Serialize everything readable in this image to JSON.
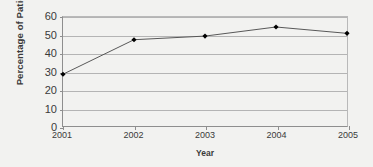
{
  "chart_data": {
    "type": "line",
    "title": "",
    "xlabel": "Year",
    "ylabel": "Percentage of Patients",
    "categories": [
      "2001",
      "2002",
      "2003",
      "2004",
      "2005"
    ],
    "values": [
      28.5,
      47.5,
      49.5,
      54.5,
      51.0
    ],
    "series": [
      {
        "name": "Percentage of Patients",
        "values": [
          28.5,
          47.5,
          49.5,
          54.5,
          51.0
        ]
      }
    ],
    "ylim": [
      0,
      60
    ],
    "yticks": [
      0,
      10,
      20,
      30,
      40,
      50,
      60
    ],
    "ytick_labels": [
      "0",
      "10",
      "20",
      "30",
      "40",
      "50",
      "60"
    ],
    "xtick_labels": [
      "2001",
      "2002",
      "2003",
      "2004",
      "2005"
    ],
    "grid": "horizontal",
    "legend": "none",
    "marker": "diamond",
    "line_color": "#555555",
    "marker_color": "#000000",
    "grid_color": "#b4b4b4",
    "axis_color": "#8e8e8e",
    "text_color": "#3a3a3a",
    "background_color": "#f2f2f0"
  }
}
